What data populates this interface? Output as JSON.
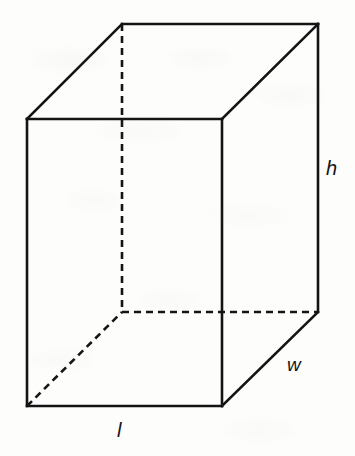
{
  "figure": {
    "kind": "rectangular-prism-diagram",
    "background_color": "#fdfdfc",
    "stroke_color": "#141414",
    "label_color": "#141414"
  },
  "labels": {
    "height": "h",
    "width": "w",
    "length": "l"
  },
  "label_positions": {
    "height": {
      "x": 332,
      "y": 169
    },
    "width": {
      "x": 294,
      "y": 365
    },
    "length": {
      "x": 121,
      "y": 430
    }
  },
  "chart_data": {
    "type": "diagram",
    "title": "",
    "shape": "rectangular prism (cuboid)",
    "projection": "oblique cabinet",
    "vertices": {
      "front_top_left": [
        27,
        119
      ],
      "front_top_right": [
        222,
        119
      ],
      "front_bottom_right": [
        222,
        406
      ],
      "front_bottom_left": [
        27,
        406
      ],
      "back_top_left": [
        122,
        24
      ],
      "back_top_right": [
        318,
        24
      ],
      "back_bottom_right": [
        318,
        312
      ],
      "back_bottom_left": [
        122,
        312
      ]
    },
    "offset_vector": [
      95,
      -95
    ],
    "solid_edges": [
      [
        "front_top_left",
        "front_top_right"
      ],
      [
        "front_top_right",
        "front_bottom_right"
      ],
      [
        "front_bottom_right",
        "front_bottom_left"
      ],
      [
        "front_bottom_left",
        "front_top_left"
      ],
      [
        "front_top_left",
        "back_top_left"
      ],
      [
        "front_top_right",
        "back_top_right"
      ],
      [
        "back_top_left",
        "back_top_right"
      ],
      [
        "back_top_right",
        "back_bottom_right"
      ],
      [
        "front_bottom_right",
        "back_bottom_right"
      ]
    ],
    "dashed_edges": [
      [
        "back_top_left",
        "back_bottom_left"
      ],
      [
        "back_bottom_left",
        "back_bottom_right"
      ],
      [
        "front_bottom_left",
        "back_bottom_left"
      ]
    ],
    "edge_labels": [
      {
        "name": "h",
        "edge": [
          "back_top_right",
          "back_bottom_right"
        ],
        "meaning": "height"
      },
      {
        "name": "w",
        "edge": [
          "front_bottom_right",
          "back_bottom_right"
        ],
        "meaning": "width / depth"
      },
      {
        "name": "l",
        "edge": [
          "front_bottom_left",
          "front_bottom_right"
        ],
        "meaning": "length"
      }
    ],
    "stroke_width_solid": 2.6,
    "stroke_width_dashed": 2.6,
    "dash_pattern": [
      7,
      5
    ]
  }
}
